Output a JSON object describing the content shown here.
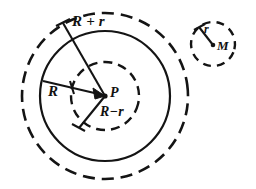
{
  "figure": {
    "type": "geometric-diagram",
    "background_color": "#ffffff",
    "stroke_color": "#111111",
    "labels": {
      "outer_radius": "R + r",
      "main_radius": "R",
      "inner_radius": "R−r",
      "main_center": "P",
      "small_center": "M",
      "small_radius": "r"
    },
    "shapes": {
      "outer_dashed_circle": {
        "cx": 105,
        "cy": 96,
        "r": 83,
        "style": "dashed"
      },
      "solid_circle": {
        "cx": 105,
        "cy": 96,
        "r": 65,
        "style": "solid"
      },
      "inner_dashed_circle": {
        "cx": 105,
        "cy": 96,
        "r": 34,
        "style": "dashed"
      },
      "small_dashed_circle": {
        "cx": 213,
        "cy": 44,
        "r": 22,
        "style": "dashed"
      },
      "center_point_main": {
        "cx": 105,
        "cy": 96
      },
      "center_point_small": {
        "cx": 213,
        "cy": 45
      }
    },
    "radius_lines": [
      {
        "name": "R + r",
        "from": [
          63,
          23
        ],
        "to": [
          105,
          96
        ]
      },
      {
        "name": "R",
        "from": [
          43,
          81
        ],
        "to": [
          105,
          96
        ]
      },
      {
        "name": "R−r",
        "from": [
          105,
          96
        ],
        "to": [
          79,
          128
        ]
      },
      {
        "name": "r",
        "from": [
          213,
          45
        ],
        "to": [
          199,
          27
        ]
      }
    ]
  }
}
